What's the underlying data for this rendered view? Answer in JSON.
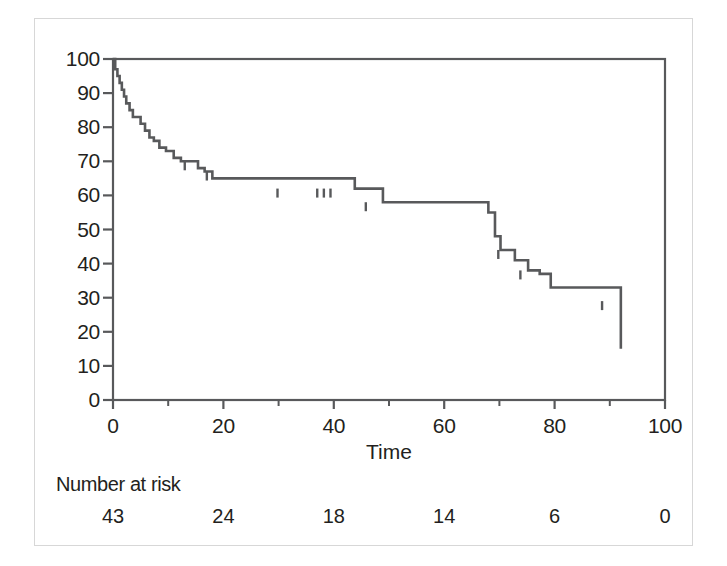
{
  "chart_data": {
    "type": "line",
    "subtype": "kaplan-meier-survival",
    "title": "",
    "xlabel": "Time",
    "ylabel": "",
    "xlim": [
      0,
      100
    ],
    "ylim": [
      0,
      100
    ],
    "grid": false,
    "legend": "none",
    "line_color": "#58595b",
    "xticks": [
      0,
      20,
      40,
      60,
      80,
      100
    ],
    "xtick_labels": [
      "0",
      "20",
      "40",
      "60",
      "80",
      "100"
    ],
    "xminor_ticks": [
      10,
      30,
      50,
      70,
      90
    ],
    "yticks": [
      0,
      10,
      20,
      30,
      40,
      50,
      60,
      70,
      80,
      90,
      100
    ],
    "ytick_labels": [
      "0",
      "10",
      "20",
      "30",
      "40",
      "50",
      "60",
      "70",
      "80",
      "90",
      "100"
    ],
    "series": [
      {
        "name": "Survival",
        "step": "post",
        "x": [
          0,
          0.4,
          0.8,
          1.2,
          1.6,
          2.0,
          2.4,
          3.0,
          3.6,
          4.3,
          5.0,
          5.8,
          6.6,
          7.4,
          8.4,
          9.6,
          11.0,
          12.3,
          13.6,
          15.4,
          16.6,
          18.0,
          24.0,
          43.8,
          48.9,
          68.0,
          69.2,
          70.2,
          72.8,
          75.2,
          77.3,
          79.3,
          92.0,
          92.0
        ],
        "y": [
          100,
          97,
          95,
          93,
          91,
          89,
          87,
          85,
          83,
          83,
          81,
          79,
          77,
          76,
          74,
          73,
          71,
          70,
          70,
          68,
          67,
          65,
          65,
          62,
          58,
          55,
          48,
          44,
          41,
          38,
          37,
          33,
          29,
          15
        ]
      }
    ],
    "censor_marks": {
      "symbol": "vertical-tick",
      "points": [
        {
          "x": 13.0,
          "y": 70
        },
        {
          "x": 17.0,
          "y": 67
        },
        {
          "x": 29.8,
          "y": 62
        },
        {
          "x": 37.0,
          "y": 62
        },
        {
          "x": 38.2,
          "y": 62
        },
        {
          "x": 39.4,
          "y": 62
        },
        {
          "x": 45.8,
          "y": 58
        },
        {
          "x": 69.8,
          "y": 44
        },
        {
          "x": 73.8,
          "y": 38
        },
        {
          "x": 88.6,
          "y": 29
        }
      ]
    },
    "number_at_risk": {
      "label": "Number at risk",
      "times": [
        0,
        20,
        40,
        60,
        80,
        100
      ],
      "values": [
        43,
        24,
        18,
        14,
        6,
        0
      ]
    }
  },
  "axis": {
    "x_title": "Time"
  }
}
